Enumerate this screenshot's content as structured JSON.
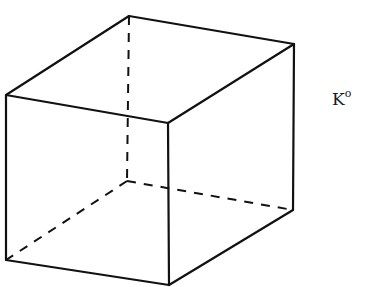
{
  "diagram": {
    "type": "wireframe-cube",
    "label": {
      "base": "K",
      "superscript": "o",
      "x": 332,
      "y": 89
    },
    "stroke_color": "#111111",
    "background": "#ffffff",
    "vertices": {
      "A_top_left_front": [
        6,
        95
      ],
      "B_top_back_left": [
        129,
        16
      ],
      "C_top_back_right": [
        294,
        44
      ],
      "D_top_front_right": [
        168,
        123
      ],
      "E_bottom_left_front": [
        6,
        260
      ],
      "F_bottom_front_right": [
        169,
        285
      ],
      "G_bottom_back_right": [
        293,
        210
      ],
      "H_bottom_back_hidden": [
        127,
        181
      ]
    },
    "solid_edges": [
      [
        "A_top_left_front",
        "B_top_back_left"
      ],
      [
        "B_top_back_left",
        "C_top_back_right"
      ],
      [
        "C_top_back_right",
        "D_top_front_right"
      ],
      [
        "D_top_front_right",
        "A_top_left_front"
      ],
      [
        "A_top_left_front",
        "E_bottom_left_front"
      ],
      [
        "D_top_front_right",
        "F_bottom_front_right"
      ],
      [
        "C_top_back_right",
        "G_bottom_back_right"
      ],
      [
        "E_bottom_left_front",
        "F_bottom_front_right"
      ],
      [
        "F_bottom_front_right",
        "G_bottom_back_right"
      ]
    ],
    "dashed_edges": [
      [
        "B_top_back_left",
        "H_bottom_back_hidden"
      ],
      [
        "H_bottom_back_hidden",
        "E_bottom_left_front"
      ],
      [
        "H_bottom_back_hidden",
        "G_bottom_back_right"
      ]
    ]
  }
}
